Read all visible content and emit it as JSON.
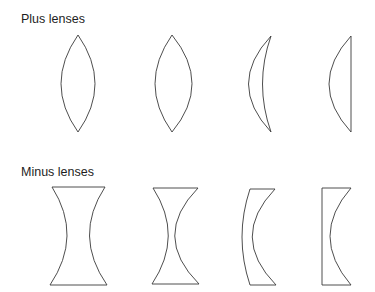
{
  "sections": [
    {
      "id": "plus",
      "label": "Plus lenses",
      "lenses": [
        {
          "name": "biconvex",
          "description": "Biconvex (symmetric)"
        },
        {
          "name": "biconvex-asymmetric",
          "description": "Biconvex (asymmetric)"
        },
        {
          "name": "positive-meniscus",
          "description": "Positive meniscus"
        },
        {
          "name": "plano-convex",
          "description": "Plano-convex"
        }
      ]
    },
    {
      "id": "minus",
      "label": "Minus lenses",
      "lenses": [
        {
          "name": "biconcave",
          "description": "Biconcave (symmetric)"
        },
        {
          "name": "biconcave-asymmetric",
          "description": "Biconcave (asymmetric)"
        },
        {
          "name": "negative-meniscus",
          "description": "Negative meniscus"
        },
        {
          "name": "plano-concave",
          "description": "Plano-concave"
        }
      ]
    }
  ],
  "colors": {
    "stroke": "#3a3a3a",
    "text": "#1e1e1e",
    "background": "#ffffff"
  }
}
